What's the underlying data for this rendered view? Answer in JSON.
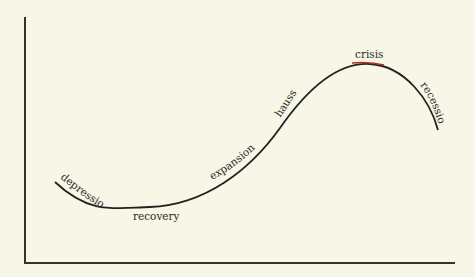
{
  "diagram": {
    "type": "business-cycle",
    "phases": [
      {
        "label": "depression"
      },
      {
        "label": "recovery"
      },
      {
        "label": "expansion"
      },
      {
        "label": "hausse"
      },
      {
        "label": "crisis"
      },
      {
        "label": "recession"
      }
    ],
    "colors": {
      "background": "#f8f6e6",
      "curve": "#222222",
      "crisis_segment": "#b03030",
      "axes": "#333333"
    }
  }
}
